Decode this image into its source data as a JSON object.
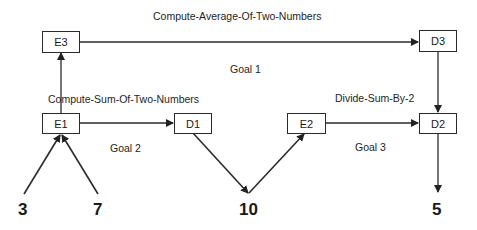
{
  "diagram": {
    "nodes": [
      {
        "id": "E3",
        "label": "E3"
      },
      {
        "id": "D3",
        "label": "D3"
      },
      {
        "id": "E1",
        "label": "E1"
      },
      {
        "id": "D1",
        "label": "D1"
      },
      {
        "id": "E2",
        "label": "E2"
      },
      {
        "id": "D2",
        "label": "D2"
      }
    ],
    "labels": {
      "top_task": "Compute-Average-Of-Two-Numbers",
      "goal1": "Goal 1",
      "sum_task": "Compute-Sum-Of-Two-Numbers",
      "divide_task": "Divide-Sum-By-2",
      "goal2": "Goal 2",
      "goal3": "Goal 3"
    },
    "values": {
      "input_a": "3",
      "input_b": "7",
      "sum": "10",
      "result": "5"
    },
    "edges": [
      {
        "from": "3",
        "to": "E1"
      },
      {
        "from": "7",
        "to": "E1"
      },
      {
        "from": "E1",
        "to": "E3"
      },
      {
        "from": "E1",
        "to": "D1"
      },
      {
        "from": "D1",
        "to": "10"
      },
      {
        "from": "10",
        "to": "E2"
      },
      {
        "from": "E2",
        "to": "D2"
      },
      {
        "from": "E3",
        "to": "D3"
      },
      {
        "from": "D3",
        "to": "D2"
      },
      {
        "from": "D2",
        "to": "5"
      }
    ]
  }
}
